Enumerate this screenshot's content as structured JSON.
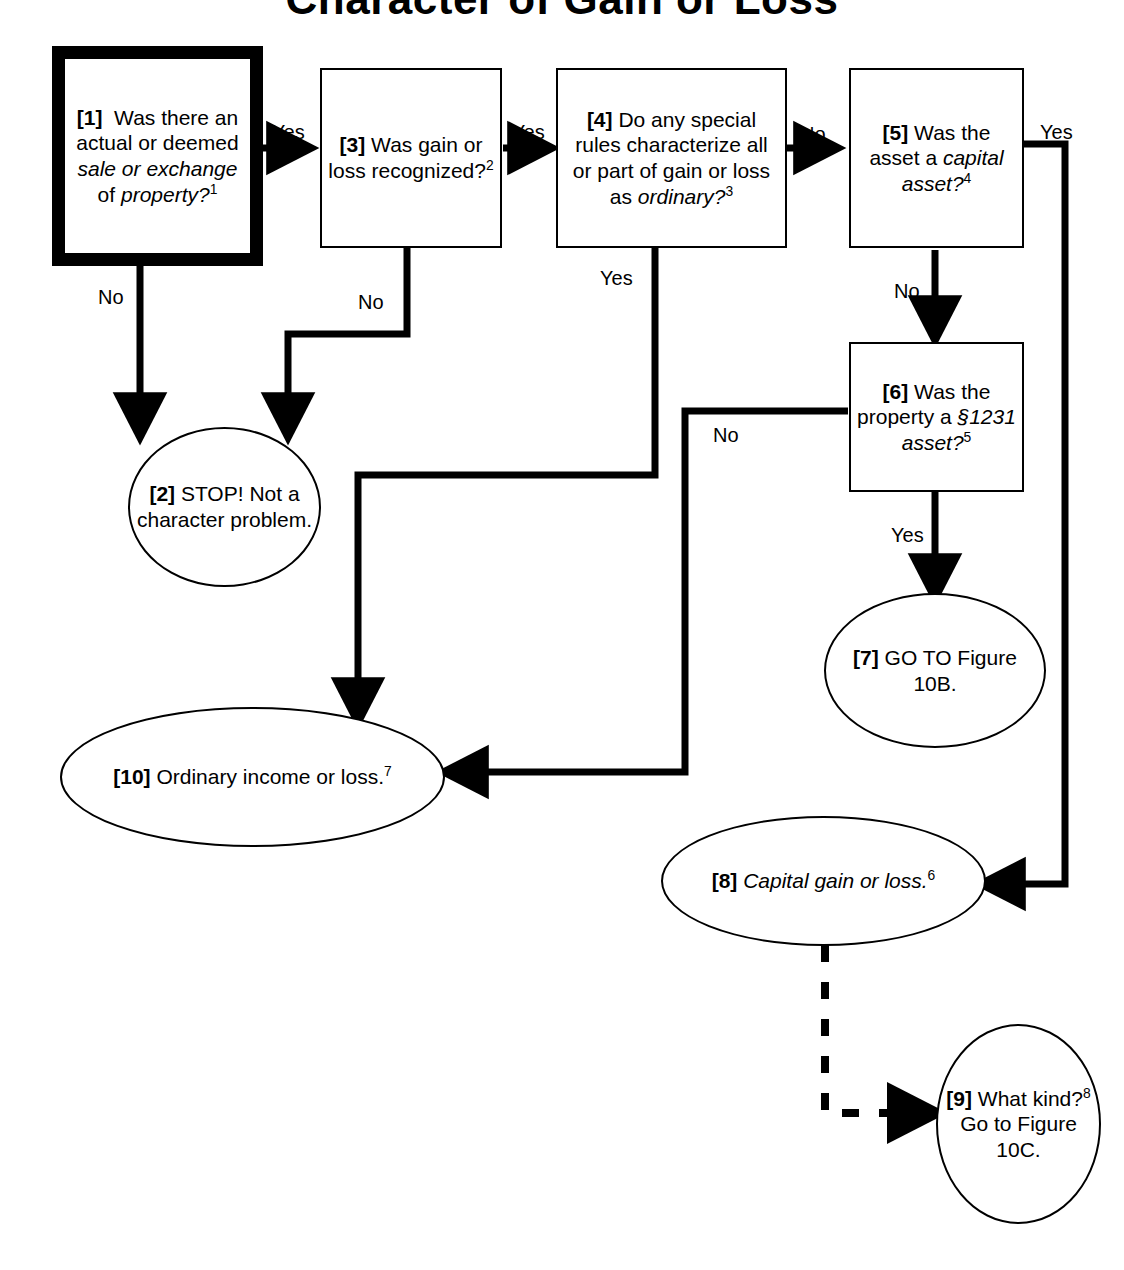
{
  "figure": {
    "title": "Character of Gain or Loss",
    "type": "decision-flowchart"
  },
  "nodes": {
    "n1": {
      "id": "[1]",
      "shape": "box",
      "emphasis": "thick-border",
      "text": "[1]  Was there an actual or deemed sale or exchange of property?1",
      "italic_parts": [
        "sale or exchange",
        "property?"
      ],
      "footnote": "1"
    },
    "n2": {
      "id": "[2]",
      "shape": "ellipse",
      "text": "[2] STOP! Not a character problem."
    },
    "n3": {
      "id": "[3]",
      "shape": "box",
      "text": "[3] Was gain or loss recognized?2",
      "footnote": "2"
    },
    "n4": {
      "id": "[4]",
      "shape": "box",
      "text": "[4] Do any special rules characterize all or part of gain or loss as ordinary?3",
      "italic_parts": [
        "ordinary?"
      ],
      "footnote": "3"
    },
    "n5": {
      "id": "[5]",
      "shape": "box",
      "text": "[5] Was the asset a capital asset?4",
      "italic_parts": [
        "capital asset?"
      ],
      "footnote": "4"
    },
    "n6": {
      "id": "[6]",
      "shape": "box",
      "text": "[6] Was the property a §1231 asset?5",
      "italic_parts": [
        "§1231 asset?"
      ],
      "footnote": "5"
    },
    "n7": {
      "id": "[7]",
      "shape": "ellipse",
      "text": "[7] GO TO Figure 10B."
    },
    "n8": {
      "id": "[8]",
      "shape": "ellipse",
      "text": "[8] Capital gain or loss.6",
      "italic_parts": [
        "Capital gain or loss."
      ],
      "footnote": "6"
    },
    "n9": {
      "id": "[9]",
      "shape": "ellipse",
      "text": "[9] What kind?8 Go to Figure 10C.",
      "footnote": "8"
    },
    "n10": {
      "id": "[10]",
      "shape": "ellipse",
      "text": "[10] Ordinary income or loss.7",
      "footnote": "7"
    }
  },
  "edge_labels": {
    "e1_yes": "Yes",
    "e1_no": "No",
    "e3_yes": "Yes",
    "e3_no": "No",
    "e4_no": "No",
    "e4_yes": "Yes",
    "e5_yes": "Yes",
    "e5_no": "No",
    "e6_no": "No",
    "e6_yes": "Yes"
  },
  "edges": [
    {
      "from": "[1]",
      "to": "[3]",
      "label": "Yes",
      "style": "solid"
    },
    {
      "from": "[1]",
      "to": "[2]",
      "label": "No",
      "style": "solid"
    },
    {
      "from": "[3]",
      "to": "[4]",
      "label": "Yes",
      "style": "solid"
    },
    {
      "from": "[3]",
      "to": "[2]",
      "label": "No",
      "style": "solid"
    },
    {
      "from": "[4]",
      "to": "[5]",
      "label": "No",
      "style": "solid"
    },
    {
      "from": "[4]",
      "to": "[10]",
      "label": "Yes",
      "style": "solid"
    },
    {
      "from": "[5]",
      "to": "[8]",
      "label": "Yes",
      "style": "solid"
    },
    {
      "from": "[5]",
      "to": "[6]",
      "label": "No",
      "style": "solid"
    },
    {
      "from": "[6]",
      "to": "[10]",
      "label": "No",
      "style": "solid"
    },
    {
      "from": "[6]",
      "to": "[7]",
      "label": "Yes",
      "style": "solid"
    },
    {
      "from": "[8]",
      "to": "[9]",
      "label": "",
      "style": "dashed"
    }
  ],
  "colors": {
    "stroke": "#000000",
    "background": "#ffffff"
  }
}
